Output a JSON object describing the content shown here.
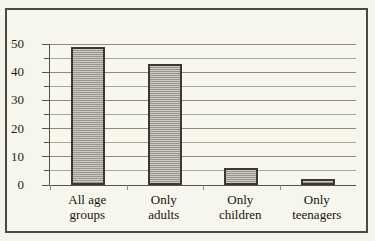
{
  "figure": {
    "title_sliver": "............",
    "background_color": "#f7f6ec",
    "frame_color": "#4a4a40"
  },
  "chart_data": {
    "type": "bar",
    "title": "",
    "xlabel": "",
    "ylabel": "",
    "categories": [
      "All age groups",
      "Only adults",
      "Only children",
      "Only teenagers"
    ],
    "category_lines": [
      [
        "All age",
        "groups"
      ],
      [
        "Only",
        "adults"
      ],
      [
        "Only",
        "children"
      ],
      [
        "Only",
        "teenagers"
      ]
    ],
    "values": [
      49,
      43,
      6,
      2
    ],
    "ylim": [
      0,
      50
    ],
    "ytick_labels": [
      "0",
      "10",
      "20",
      "30",
      "40",
      "50"
    ],
    "ytick_values": [
      0,
      10,
      20,
      30,
      40,
      50
    ],
    "minor_tick_step": 5,
    "grid": true,
    "legend": "none",
    "bar_fill_color": "#a8a49a",
    "bar_edge_color": "#3a3a32",
    "gridline_color": "#a9a99a"
  }
}
